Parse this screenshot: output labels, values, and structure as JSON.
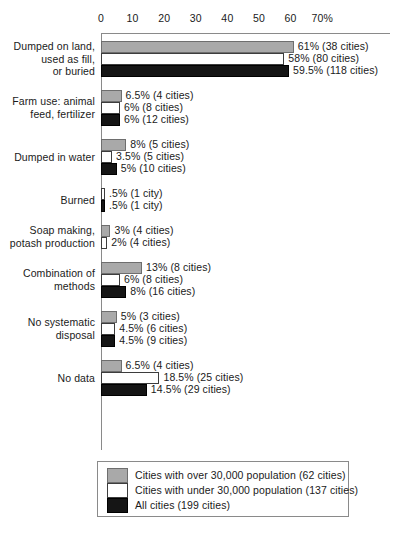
{
  "chart_data": {
    "type": "bar",
    "orientation": "horizontal",
    "title": "",
    "subtitle": "",
    "xlabel": "",
    "ylabel": "",
    "xlim": [
      0,
      73
    ],
    "grid": false,
    "legend_position": "bottom",
    "axis_ticks": [
      "0",
      "10",
      "20",
      "30",
      "40",
      "50",
      "60",
      "70%"
    ],
    "axis_tick_values": [
      0,
      10,
      20,
      30,
      40,
      50,
      60,
      70
    ],
    "categories": [
      "Dumped on land,\nused as fill,\nor buried",
      "Farm use: animal\nfeed, fertilizer",
      "Dumped in water",
      "Burned",
      "Soap making,\npotash production",
      "Combination of\nmethods",
      "No systematic\ndisposal",
      "No data"
    ],
    "series": [
      {
        "name": "Cities with over 30,000 population (62 cities)",
        "key": "over",
        "color": "#a9a9a9",
        "values": [
          61,
          6.5,
          8,
          null,
          3,
          13,
          5,
          6.5
        ],
        "labels": [
          "61% (38 cities)",
          "6.5% (4 cities)",
          "8% (5 cities)",
          null,
          "3% (4 cities)",
          "13% (8 cities)",
          "5% (3 cities)",
          "6.5% (4 cities)"
        ]
      },
      {
        "name": "Cities with under 30,000 population (137 cities)",
        "key": "under",
        "color": "#ffffff",
        "values": [
          58,
          6,
          3.5,
          0.5,
          2,
          6,
          4.5,
          18.5
        ],
        "labels": [
          "58% (80 cities)",
          "6% (8 cities)",
          "3.5% (5 cities)",
          ".5% (1 city)",
          "2% (4 cities)",
          "6% (8 cities)",
          "4.5% (6 cities)",
          "18.5% (25 cities)"
        ]
      },
      {
        "name": "All cities (199 cities)",
        "key": "all",
        "color": "#151515",
        "values": [
          59.5,
          6,
          5,
          0.5,
          null,
          8,
          4.5,
          14.5
        ],
        "labels": [
          "59.5% (118 cities)",
          "6% (12 cities)",
          "5% (10 cities)",
          ".5% (1 city)",
          null,
          "8% (16 cities)",
          "4.5% (9 cities)",
          "14.5% (29 cities)"
        ]
      }
    ]
  },
  "legend": {
    "items": [
      {
        "key": "over",
        "label": "Cities with over 30,000 population (62 cities)",
        "color": "#a9a9a9"
      },
      {
        "key": "under",
        "label": "Cities with under 30,000 population (137 cities)",
        "color": "#ffffff"
      },
      {
        "key": "all",
        "label": "All cities (199 cities)",
        "color": "#151515"
      }
    ]
  },
  "colors": {
    "over_30k": "#a9a9a9",
    "under_30k": "#ffffff",
    "all_cities": "#151515",
    "axis": "#8a8a8a",
    "text": "#1a1a1a",
    "background": "#ffffff"
  }
}
